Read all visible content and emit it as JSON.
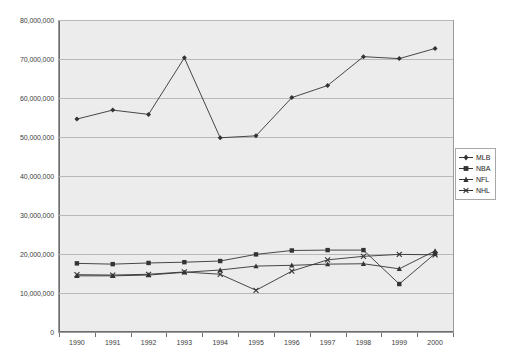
{
  "chart_data": {
    "type": "line",
    "title": "",
    "xlabel": "",
    "ylabel": "",
    "x": [
      1990,
      1991,
      1992,
      1993,
      1994,
      1995,
      1996,
      1997,
      1998,
      1999,
      2000
    ],
    "categories": [
      "1990",
      "1991",
      "1992",
      "1993",
      "1994",
      "1995",
      "1996",
      "1997",
      "1998",
      "1999",
      "2000"
    ],
    "ylim": [
      0,
      80000000
    ],
    "ytick_values": [
      0,
      10000000,
      20000000,
      30000000,
      40000000,
      50000000,
      60000000,
      70000000,
      80000000
    ],
    "ytick_labels": [
      "0",
      "10,000,000",
      "20,000,000",
      "30,000,000",
      "40,000,000",
      "50,000,000",
      "60,000,000",
      "70,000,000",
      "80,000,000"
    ],
    "grid": true,
    "legend_position": "right",
    "plot_background": "#ececec",
    "series": [
      {
        "name": "MLB",
        "marker": "diamond",
        "color": "#333333",
        "values": [
          54600000,
          56900000,
          55800000,
          70300000,
          49800000,
          50300000,
          60100000,
          63200000,
          70600000,
          70100000,
          72700000
        ]
      },
      {
        "name": "NBA",
        "marker": "square",
        "color": "#333333",
        "values": [
          17600000,
          17400000,
          17700000,
          17900000,
          18200000,
          19900000,
          20900000,
          21000000,
          21000000,
          12300000,
          20100000
        ]
      },
      {
        "name": "NFL",
        "marker": "triangle",
        "color": "#333333",
        "values": [
          14400000,
          14400000,
          14600000,
          15300000,
          15900000,
          16900000,
          17100000,
          17400000,
          17500000,
          16200000,
          20800000
        ]
      },
      {
        "name": "NHL",
        "marker": "x",
        "color": "#333333",
        "values": [
          14700000,
          14600000,
          14800000,
          15400000,
          14800000,
          10700000,
          15600000,
          18500000,
          19400000,
          19900000,
          19800000
        ]
      }
    ]
  },
  "legend": {
    "items": [
      {
        "label": "MLB"
      },
      {
        "label": "NBA"
      },
      {
        "label": "NFL"
      },
      {
        "label": "NHL"
      }
    ]
  }
}
